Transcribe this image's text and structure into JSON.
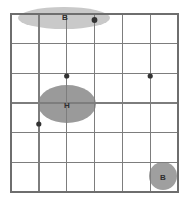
{
  "figure": {
    "title": "",
    "background_color": "#ffffff",
    "width": 189,
    "height": 208
  },
  "grid": {
    "columns": 6,
    "rows": 6,
    "line_color": "#7d7d7d",
    "frame_color": "#6e6e6e",
    "x_min": 11,
    "x_max": 178,
    "y_min": 14,
    "y_max": 192,
    "x_positions": [
      11,
      38.8,
      66.7,
      94.5,
      122.3,
      150.2,
      178
    ],
    "y_positions": [
      14,
      43.7,
      73.3,
      103,
      132.7,
      162.3,
      192
    ]
  },
  "regions": [
    {
      "id": "region-b-top",
      "label": "B",
      "shape": "ellipse",
      "cx": 64,
      "cy": 18,
      "rx": 46,
      "ry": 11,
      "color": "#c9c9c9",
      "label_x": 65,
      "label_y": 17,
      "label_color": "#3a3a3a"
    },
    {
      "id": "region-h-center",
      "label": "H",
      "shape": "ellipse",
      "cx": 67,
      "cy": 104,
      "rx": 29,
      "ry": 19,
      "color": "#9a9a9a",
      "label_x": 67,
      "label_y": 105,
      "label_color": "#2e2e2e"
    },
    {
      "id": "region-b-bottom-right",
      "label": "B",
      "shape": "circle",
      "cx": 163,
      "cy": 176,
      "rx": 14,
      "ry": 14,
      "color": "#9f9f9f",
      "label_x": 163,
      "label_y": 177,
      "label_color": "#2e2e2e"
    }
  ],
  "data_points": [
    {
      "id": "point-1",
      "x": 94.5,
      "y": 20,
      "r": 2.9,
      "color": "#333333"
    },
    {
      "id": "point-2",
      "x": 66.7,
      "y": 76,
      "r": 2.6,
      "color": "#333333"
    },
    {
      "id": "point-3",
      "x": 150.2,
      "y": 76,
      "r": 2.6,
      "color": "#333333"
    },
    {
      "id": "point-4",
      "x": 38.8,
      "y": 124,
      "r": 2.6,
      "color": "#333333"
    }
  ],
  "chart_data": {
    "type": "scatter",
    "title": "",
    "xlabel": "",
    "ylabel": "",
    "grid": true,
    "legend": "none",
    "xlim": [
      0,
      6
    ],
    "ylim": [
      0,
      6
    ],
    "x_tick_labels": [],
    "y_tick_labels": [],
    "series": [
      {
        "name": "points",
        "marker": "circle",
        "color": "#333333",
        "x": [
          3.0,
          2.0,
          5.0,
          1.0
        ],
        "y": [
          5.8,
          3.9,
          3.9,
          2.3
        ]
      }
    ],
    "annotations": [
      {
        "text": "B",
        "shape": "ellipse",
        "x": 1.91,
        "y": 5.86,
        "rx": 1.65,
        "ry": 0.37
      },
      {
        "text": "H",
        "shape": "ellipse",
        "x": 2.01,
        "y": 2.96,
        "rx": 1.04,
        "ry": 0.64
      },
      {
        "text": "B",
        "shape": "circle",
        "x": 5.47,
        "y": 0.54,
        "rx": 0.5,
        "ry": 0.47
      }
    ]
  }
}
